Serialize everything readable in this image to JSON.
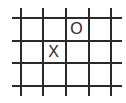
{
  "game": {
    "type": "grid-board",
    "columns": [
      20,
      42,
      65,
      88,
      110
    ],
    "rows": [
      17,
      40,
      62,
      85
    ],
    "line_color": "#2a2a2a",
    "marks": [
      {
        "symbol": "O",
        "col": 2,
        "row": 0
      },
      {
        "symbol": "X",
        "col": 1,
        "row": 1
      }
    ]
  }
}
